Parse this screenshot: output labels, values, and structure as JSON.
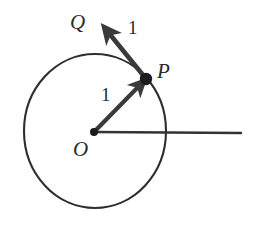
{
  "figure": {
    "background_color": "#ffffff",
    "stroke_color": "#2b2b2b",
    "width": 254,
    "height": 233,
    "labels": {
      "center_point": "O",
      "circle_point": "P",
      "arrow_tip_point": "Q",
      "length_op": "1",
      "length_pq": "1"
    },
    "geometry": {
      "circle": {
        "center_x": 95,
        "center_y": 131,
        "radius_x": 71,
        "radius_y": 77,
        "stroke_width": 2.1
      },
      "center_dot": {
        "x": 94,
        "y": 132,
        "r": 4.0
      },
      "point_p_dot": {
        "x": 146,
        "y": 79,
        "r": 6.2
      },
      "vector_op": {
        "x1": 95,
        "y1": 131,
        "x2": 143,
        "y2": 82,
        "label": "1",
        "stroke_width": 4.2
      },
      "vector_pq": {
        "x1": 147,
        "y1": 80,
        "x2": 104,
        "y2": 27,
        "label": "1",
        "stroke_width": 4.6
      },
      "horizontal_ray": {
        "x1": 95,
        "y1": 132,
        "x2": 241,
        "y2": 133,
        "stroke_width": 2.4
      }
    }
  }
}
